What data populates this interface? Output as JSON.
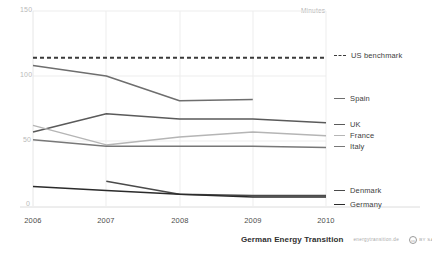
{
  "chart_data": {
    "type": "line",
    "title": "",
    "subtitle": "",
    "xlabel": "",
    "ylabel": "",
    "unit_label": "Minutes",
    "x": [
      2006,
      2007,
      2008,
      2009,
      2010
    ],
    "xtick_labels": [
      "2006",
      "2007",
      "2008",
      "2009",
      "2010"
    ],
    "ytick_labels": [
      "150",
      "100",
      "50",
      "0"
    ],
    "ytick_values": [
      150,
      100,
      50,
      0
    ],
    "ylim": [
      0,
      150
    ],
    "xlim": [
      2006,
      2010
    ],
    "grid": "vertical-and-horizontal-light",
    "legend_position": "right",
    "series": [
      {
        "name": "US benchmark",
        "style": "dashed",
        "color": "#3a3a3a",
        "x": [
          2006,
          2007,
          2008,
          2009,
          2010
        ],
        "values": [
          114,
          114,
          114,
          114,
          114
        ]
      },
      {
        "name": "Spain",
        "style": "solid",
        "color": "#6e6e6e",
        "x": [
          2006,
          2007,
          2008,
          2009
        ],
        "values": [
          108,
          100,
          81,
          82
        ]
      },
      {
        "name": "UK",
        "style": "solid",
        "color": "#5a5a5a",
        "x": [
          2006,
          2007,
          2008,
          2009,
          2010
        ],
        "values": [
          57,
          71,
          67,
          67,
          64
        ]
      },
      {
        "name": "France",
        "style": "solid",
        "color": "#b5b5b5",
        "x": [
          2006,
          2007,
          2008,
          2009,
          2010
        ],
        "values": [
          62,
          47,
          53,
          57,
          54
        ]
      },
      {
        "name": "Italy",
        "style": "solid",
        "color": "#787878",
        "x": [
          2006,
          2007,
          2008,
          2009,
          2010
        ],
        "values": [
          51,
          46,
          46,
          46,
          45
        ]
      },
      {
        "name": "Denmark",
        "style": "solid",
        "color": "#4a4a4a",
        "x": [
          2007,
          2008,
          2009,
          2010
        ],
        "values": [
          19,
          9,
          8,
          8
        ]
      },
      {
        "name": "Germany",
        "style": "solid",
        "color": "#2b2b2b",
        "x": [
          2006,
          2007,
          2008,
          2009,
          2010
        ],
        "values": [
          15,
          12,
          9,
          7,
          7
        ]
      }
    ]
  },
  "legend": {
    "items": [
      {
        "label": "US benchmark",
        "color": "#3a3a3a",
        "dashed": true,
        "top": 51
      },
      {
        "label": "Spain",
        "color": "#6e6e6e",
        "dashed": false,
        "top": 94
      },
      {
        "label": "UK",
        "color": "#5a5a5a",
        "dashed": false,
        "top": 120
      },
      {
        "label": "France",
        "color": "#b5b5b5",
        "dashed": false,
        "top": 131
      },
      {
        "label": "Italy",
        "color": "#787878",
        "dashed": false,
        "top": 142
      },
      {
        "label": "Denmark",
        "color": "#4a4a4a",
        "dashed": false,
        "top": 186
      },
      {
        "label": "Germany",
        "color": "#2b2b2b",
        "dashed": false,
        "top": 200
      }
    ]
  },
  "footer": {
    "brand": "German Energy Transition",
    "url": "energytransition.de",
    "license_mark": "cc",
    "license_tail": "BY SA"
  }
}
